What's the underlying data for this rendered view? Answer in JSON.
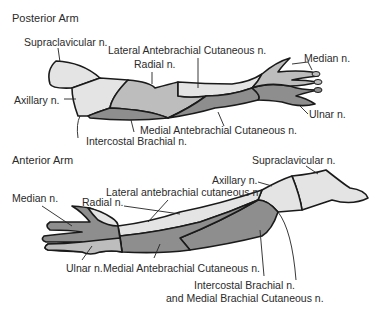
{
  "posterior": {
    "title": "Posterior Arm",
    "labels": {
      "supraclavicular": "Supraclavicular n.",
      "lateral_antebrachial": "Lateral Antebrachial Cutaneous n.",
      "radial": "Radial n.",
      "median": "Median n.",
      "axillary": "Axillary n.",
      "ulnar": "Ulnar n.",
      "medial_antebrachial": "Medial Antebrachial Cutaneous n.",
      "intercostal_brachial": "Intercostal Brachial n."
    }
  },
  "anterior": {
    "title": "Anterior Arm",
    "labels": {
      "supraclavicular": "Supraclavicular n.",
      "axillary": "Axillary n.",
      "lateral_antebrachial": "Lateral antebrachial cutaneous n.",
      "median": "Median n.",
      "radial": "Radial n.",
      "ulnar": "Ulnar n.",
      "medial_antebrachial": "Medial Antebrachial Cutaneous n.",
      "intercostal_brachial": "Intercostal Brachial n.",
      "medial_brachial": "and Medial Brachial Cutaneous n."
    }
  },
  "colors": {
    "light": "#e4e4e4",
    "mid": "#bdbdbd",
    "dark": "#8e8e8e",
    "outline": "#1a1a1a"
  }
}
